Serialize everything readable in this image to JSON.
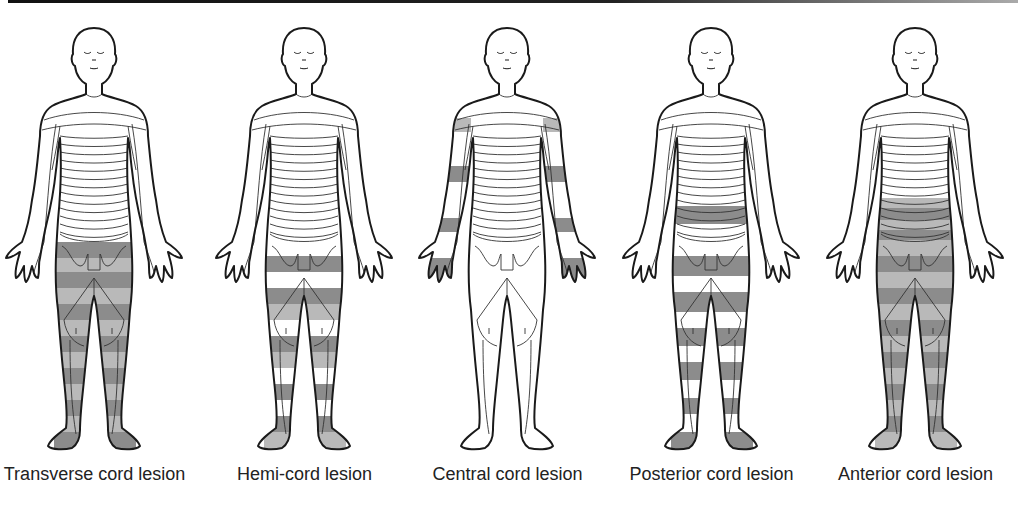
{
  "figure_title": "Sensory loss patterns in spinal cord lesions",
  "colors": {
    "outline": "#1a1a1a",
    "dermatome_line": "#333333",
    "shade_dark": "#8c8c8c",
    "shade_light": "#b9b9b9",
    "skin": "#ffffff"
  },
  "figures": [
    {
      "id": "transverse",
      "caption": "Transverse cord lesion",
      "pattern": "bilateral-below-level",
      "affected_regions": [
        "legs",
        "perineum",
        "lower-abdomen"
      ],
      "shade": "striped-dark-light"
    },
    {
      "id": "hemi",
      "caption": "Hemi-cord lesion",
      "pattern": "alternating-bands-both-legs",
      "affected_regions": [
        "legs"
      ],
      "shade": "striped-dark-light-white"
    },
    {
      "id": "central",
      "caption": "Central cord lesion",
      "pattern": "cape-arms",
      "affected_regions": [
        "upper-arms",
        "forearms",
        "hands"
      ],
      "shade": "bands-on-arms"
    },
    {
      "id": "posterior",
      "caption": "Posterior cord lesion",
      "pattern": "dorsal-column-bands",
      "affected_regions": [
        "lower-abdomen",
        "legs",
        "feet"
      ],
      "shade": "dark-white-bands"
    },
    {
      "id": "anterior",
      "caption": "Anterior cord lesion",
      "pattern": "bilateral-below-level",
      "affected_regions": [
        "abdomen",
        "legs",
        "feet"
      ],
      "shade": "striped-dark-light"
    }
  ]
}
